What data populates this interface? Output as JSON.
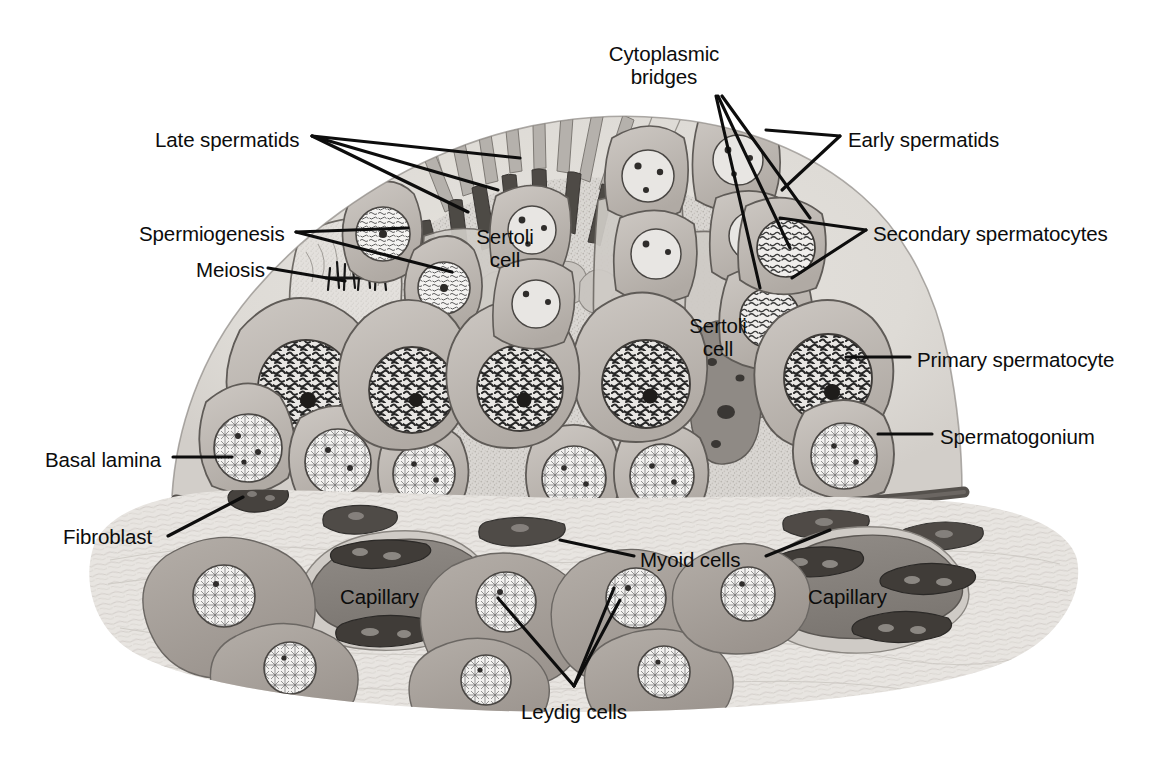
{
  "figure": {
    "background_color": "#ffffff",
    "line_color": "#111111",
    "palette": {
      "lumen_fill": "#d9d6d2",
      "sertoli_cytoplasm": "#cfcbc6",
      "germ_cell_fill": "#bdb8b3",
      "germ_cell_dark": "#a39d98",
      "nucleus_light": "#efeeec",
      "nucleus_mid": "#b7b2ad",
      "chromatin_dark": "#2b2b2b",
      "basal_lamina": "#6e6a66",
      "interstitium": "#e4e1dd",
      "leydig_fill": "#a9a39d",
      "capillary_fill": "#8c8782",
      "capillary_lumen": "#7e7974",
      "endothelial_nucleus": "#4d4945"
    }
  },
  "labels": [
    {
      "id": "late-spermatids",
      "text": "Late spermatids",
      "x": 155,
      "y": 128,
      "align": "left"
    },
    {
      "id": "cytoplasmic-bridges",
      "text": "Cytoplasmic\nbridges",
      "x": 664,
      "y": 42,
      "align": "center"
    },
    {
      "id": "early-spermatids",
      "text": "Early spermatids",
      "x": 848,
      "y": 128,
      "align": "left"
    },
    {
      "id": "spermiogenesis",
      "text": "Spermiogenesis",
      "x": 139,
      "y": 222,
      "align": "left"
    },
    {
      "id": "meiosis",
      "text": "Meiosis",
      "x": 196,
      "y": 258,
      "align": "left"
    },
    {
      "id": "secondary-spermatocytes",
      "text": "Secondary spermatocytes",
      "x": 873,
      "y": 222,
      "align": "left"
    },
    {
      "id": "sertoli-cell-left",
      "text": "Sertoli\ncell",
      "x": 505,
      "y": 225,
      "align": "center"
    },
    {
      "id": "sertoli-cell-right",
      "text": "Sertoli\ncell",
      "x": 718,
      "y": 314,
      "align": "center"
    },
    {
      "id": "primary-spermatocyte",
      "text": "Primary spermatocyte",
      "x": 917,
      "y": 348,
      "align": "left"
    },
    {
      "id": "spermatogonium",
      "text": "Spermatogonium",
      "x": 940,
      "y": 425,
      "align": "left"
    },
    {
      "id": "basal-lamina",
      "text": "Basal lamina",
      "x": 45,
      "y": 448,
      "align": "left"
    },
    {
      "id": "fibroblast",
      "text": "Fibroblast",
      "x": 63,
      "y": 525,
      "align": "left"
    },
    {
      "id": "myoid-cells",
      "text": "Myoid cells",
      "x": 640,
      "y": 548,
      "align": "left"
    },
    {
      "id": "capillary-left",
      "text": "Capillary",
      "x": 340,
      "y": 585,
      "align": "left"
    },
    {
      "id": "capillary-right",
      "text": "Capillary",
      "x": 808,
      "y": 585,
      "align": "left"
    },
    {
      "id": "leydig-cells",
      "text": "Leydig cells",
      "x": 574,
      "y": 700,
      "align": "center"
    }
  ],
  "leader_lines": [
    {
      "id": "leader-late-spermatids-1",
      "from": "late-spermatids",
      "points": "312,136 520,158"
    },
    {
      "id": "leader-late-spermatids-2",
      "from": "late-spermatids",
      "points": "312,136 498,190"
    },
    {
      "id": "leader-late-spermatids-3",
      "from": "late-spermatids",
      "points": "312,136 468,212"
    },
    {
      "id": "leader-cytoplasmic-bridges-1",
      "from": "cytoplasmic-bridges",
      "points": "716,96 760,288"
    },
    {
      "id": "leader-cytoplasmic-bridges-2",
      "from": "cytoplasmic-bridges",
      "points": "718,96 790,248"
    },
    {
      "id": "leader-cytoplasmic-bridges-3",
      "from": "cytoplasmic-bridges",
      "points": "722,96 810,218"
    },
    {
      "id": "leader-early-spermatids-1",
      "from": "early-spermatids",
      "points": "840,136 766,130"
    },
    {
      "id": "leader-early-spermatids-2",
      "from": "early-spermatids",
      "points": "840,136 782,190"
    },
    {
      "id": "leader-secondary-1",
      "from": "secondary-spermatocytes",
      "points": "866,230 780,218"
    },
    {
      "id": "leader-secondary-2",
      "from": "secondary-spermatocytes",
      "points": "866,230 792,278"
    },
    {
      "id": "leader-spermiogenesis-1",
      "from": "spermiogenesis",
      "points": "296,232 408,228"
    },
    {
      "id": "leader-spermiogenesis-2",
      "from": "spermiogenesis",
      "points": "296,232 452,272"
    },
    {
      "id": "leader-meiosis",
      "from": "meiosis",
      "points": "268,268 345,281"
    },
    {
      "id": "leader-primary-spermatocyte",
      "from": "primary-spermatocyte",
      "points": "910,357 846,357"
    },
    {
      "id": "leader-spermatogonium",
      "from": "spermatogonium",
      "points": "932,434 878,434"
    },
    {
      "id": "leader-basal-lamina",
      "from": "basal-lamina",
      "points": "173,457 232,457"
    },
    {
      "id": "leader-fibroblast",
      "from": "fibroblast",
      "points": "168,536 243,497"
    },
    {
      "id": "leader-myoid-cells-1",
      "from": "myoid-cells",
      "points": "634,556 560,540"
    },
    {
      "id": "leader-myoid-cells-2",
      "from": "myoid-cells",
      "points": "766,556 830,530"
    },
    {
      "id": "leader-leydig-1",
      "from": "leydig-cells",
      "points": "574,686 498,598"
    },
    {
      "id": "leader-leydig-2",
      "from": "leydig-cells",
      "points": "574,686 620,600"
    },
    {
      "id": "leader-leydig-3",
      "from": "leydig-cells",
      "points": "574,686 614,588"
    }
  ],
  "structures": {
    "tubule": {
      "name": "seminiferous-tubule",
      "description": "dome-shaped cross-section of seminiferous tubule"
    },
    "lumen": {
      "name": "tubule-lumen",
      "description": "granular central lumen with spermatid tails"
    },
    "basal_lamina": {
      "name": "basal-lamina-band",
      "description": "dark wavy band at the base of the epithelium"
    },
    "interstitium": {
      "name": "interstitial-tissue",
      "description": "connective tissue below the tubule containing Leydig cells and capillaries"
    },
    "spermatid_tails_count": 10,
    "leydig_cell_count": 7,
    "capillary_count": 2
  }
}
